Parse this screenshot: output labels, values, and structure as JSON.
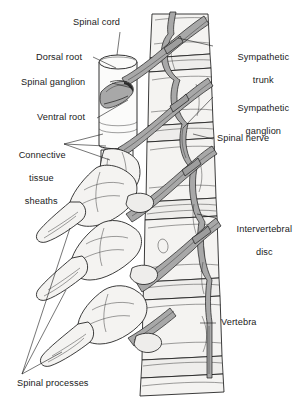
{
  "figure": {
    "background_color": "#ffffff",
    "ink_color": "#1a1a1a",
    "nerve_fill_color": "#a8a8a8",
    "bone_fill_color": "#f2f2f0",
    "width": 303,
    "height": 406
  },
  "labels": {
    "spinal_cord": "Spinal cord",
    "dorsal_root": "Dorsal root",
    "spinal_ganglion": "Spinal ganglion",
    "ventral_root": "Ventral root",
    "connective_tissue_sheaths_line1": "Connective",
    "connective_tissue_sheaths_line2": "tissue",
    "connective_tissue_sheaths_line3": "sheaths",
    "spinal_processes": "Spinal processes",
    "sympathetic_trunk_line1": "Sympathetic",
    "sympathetic_trunk_line2": "trunk",
    "sympathetic_ganglion_line1": "Sympathetic",
    "sympathetic_ganglion_line2": "ganglion",
    "spinal_nerve": "Spinal nerve",
    "intervertebral_disc_line1": "Intervertebral",
    "intervertebral_disc_line2": "disc",
    "vertebra": "Vertebra"
  }
}
